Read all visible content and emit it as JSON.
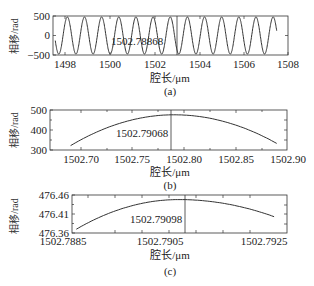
{
  "chart_data": [
    {
      "id": "a",
      "type": "line",
      "caption": "(a)",
      "xlabel": "腔长/μm",
      "ylabel": "相移/rad",
      "xlim": [
        1497.6,
        1508.0
      ],
      "ylim": [
        -500,
        500
      ],
      "xticks": [
        1498,
        1500,
        1502,
        1504,
        1506,
        1508
      ],
      "xtick_labels": [
        "1498",
        "1500",
        "1502",
        "1504",
        "1506",
        "1508"
      ],
      "yticks": [
        -500,
        0,
        500
      ],
      "ytick_labels": [
        "−500",
        "0",
        "500"
      ],
      "series": [
        {
          "name": "phase shift",
          "description": "sinusoidal oscillation, amplitude ~476 rad, period ~0.76 μm",
          "x_range": [
            1497.7,
            1507.5
          ],
          "amplitude": 476,
          "period": 0.7589
        }
      ],
      "annotation": {
        "text": "1502.78868",
        "x": 1502.78868
      },
      "grid": false
    },
    {
      "id": "b",
      "type": "line",
      "caption": "(b)",
      "xlabel": "腔长/μm",
      "ylabel": "相移/rad",
      "xlim": [
        1502.67,
        1502.9
      ],
      "ylim": [
        300,
        500
      ],
      "xticks": [
        1502.7,
        1502.75,
        1502.8,
        1502.85,
        1502.9
      ],
      "xtick_labels": [
        "1502.70",
        "1502.75",
        "1502.80",
        "1502.85",
        "1502.90"
      ],
      "yticks": [
        300,
        400,
        500
      ],
      "ytick_labels": [
        "300",
        "400",
        "500"
      ],
      "series": [
        {
          "name": "phase shift",
          "x": [
            1502.69,
            1502.72,
            1502.75,
            1502.77,
            1502.79068,
            1502.81,
            1502.83,
            1502.86,
            1502.89
          ],
          "y": [
            322,
            392,
            440,
            462,
            476,
            468,
            447,
            397,
            333
          ]
        }
      ],
      "annotation": {
        "text": "1502.79068",
        "x": 1502.79068
      },
      "grid": false
    },
    {
      "id": "c",
      "type": "line",
      "caption": "(c)",
      "xlabel": "腔长/μm",
      "ylabel": "相移/rad",
      "xlim": [
        1502.7885,
        1502.7935
      ],
      "ylim": [
        476.36,
        476.46
      ],
      "xticks": [
        1502.7885,
        1502.7905,
        1502.7925
      ],
      "xtick_labels": [
        "1502.7885",
        "1502.7905",
        "1502.7925"
      ],
      "yticks": [
        476.36,
        476.41,
        476.46
      ],
      "ytick_labels": [
        "476.36",
        "476.41",
        "476.46"
      ],
      "series": [
        {
          "name": "phase shift",
          "x": [
            1502.7886,
            1502.7895,
            1502.7905,
            1502.79098,
            1502.7915,
            1502.7925,
            1502.7932
          ],
          "y": [
            476.37,
            476.415,
            476.443,
            476.448,
            476.445,
            476.425,
            476.403
          ]
        }
      ],
      "annotation": {
        "text": "1502.79098",
        "x": 1502.79098
      },
      "grid": false
    }
  ],
  "panels": {
    "a": {
      "ylabel": "相移/rad",
      "xlabel": "腔长/μm",
      "caption": "(a)",
      "annotation": "1502.78868",
      "yt": [
        "500",
        "0",
        "−500"
      ],
      "xt": [
        "1498",
        "1500",
        "1502",
        "1504",
        "1506",
        "1508"
      ]
    },
    "b": {
      "ylabel": "相移/rad",
      "xlabel": "腔长/μm",
      "caption": "(b)",
      "annotation": "1502.79068",
      "yt": [
        "500",
        "400",
        "300"
      ],
      "xt": [
        "1502.70",
        "1502.75",
        "1502.80",
        "1502.85",
        "1502.90"
      ]
    },
    "c": {
      "ylabel": "相移/rad",
      "xlabel": "腔长/μm",
      "caption": "(c)",
      "annotation": "1502.79098",
      "yt": [
        "476.46",
        "476.41",
        "476.36"
      ],
      "xt": [
        "1502.7885",
        "1502.7905",
        "1502.7925"
      ]
    }
  }
}
